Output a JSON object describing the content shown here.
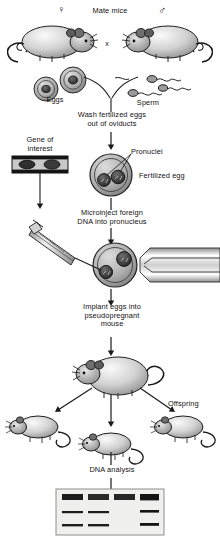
{
  "diagram": {
    "steps": {
      "mate": "Mate mice",
      "wash": "Wash fertilized eggs\nout of oviducts",
      "microinject": "Microinject  foreign\nDNA into pronucleus",
      "implant": "Implant eggs into\npseudopregnant\nmouse",
      "dna_analysis": "DNA analysis"
    },
    "labels": {
      "female_symbol": "♀",
      "male_symbol": "♂",
      "cross": "x",
      "eggs": "Eggs",
      "sperm": "Sperm",
      "gene_of_interest": "Gene of\ninterest",
      "pronuclei": "Pronuclei",
      "fertilized_egg": "Fertilized egg",
      "offspring": "Offspring"
    },
    "colors": {
      "ink": "#111111",
      "mouse_body": "#d8d8d8",
      "mouse_shade": "#9a9a9a",
      "egg_cytoplasm": "#b4b4b4",
      "pronucleus": "#4a4a4a",
      "gel_background": "#efefee",
      "gel_band": "#1c1c1c"
    },
    "gel": {
      "lane_count": 4,
      "lanes": [
        {
          "lane": 1,
          "well": true,
          "bands": [
            "middle",
            "bottom"
          ]
        },
        {
          "lane": 2,
          "well": true,
          "bands": [
            "middle",
            "bottom"
          ]
        },
        {
          "lane": 3,
          "well": true,
          "bands": []
        },
        {
          "lane": 4,
          "well": true,
          "bands": [
            "middle",
            "bottom"
          ]
        }
      ]
    },
    "counts": {
      "eggs": 2,
      "sperm": 3,
      "pronuclei": 2,
      "offspring": 3
    }
  }
}
